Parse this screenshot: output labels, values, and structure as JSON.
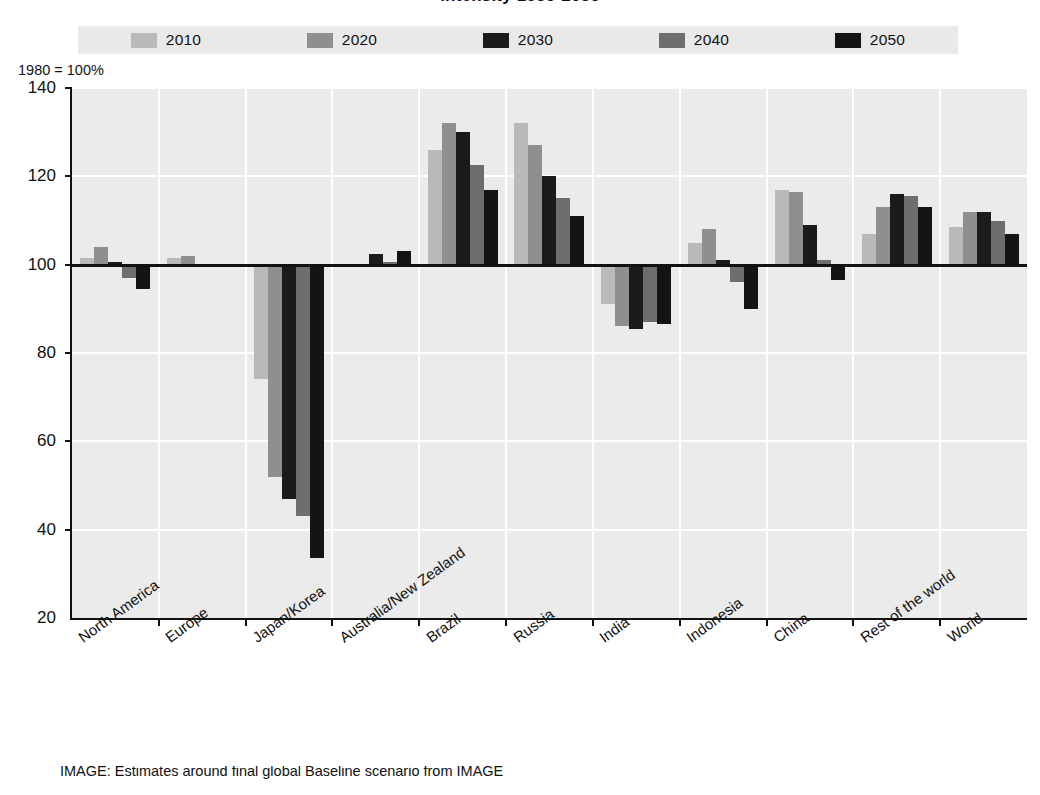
{
  "title": "intensity 1980-2050",
  "axis_note": "1980 = 100%",
  "caption": "IMAGE: Estimates around final global  Baseline scenario from IMAGE",
  "legend": {
    "items": [
      {
        "label": "2010",
        "color": "#b9b9b9"
      },
      {
        "label": "2020",
        "color": "#8f8f8f"
      },
      {
        "label": "2030",
        "color": "#1b1b1b"
      },
      {
        "label": "2040",
        "color": "#6e6e6e"
      },
      {
        "label": "2050",
        "color": "#141414"
      }
    ]
  },
  "chart_data": {
    "type": "bar",
    "title": "intensity 1980-2050",
    "xlabel": "",
    "ylabel": "1980 = 100%",
    "ylim": [
      20,
      140
    ],
    "yticks": [
      20,
      40,
      60,
      80,
      100,
      120,
      140
    ],
    "baseline": 100,
    "grid": true,
    "legend_position": "top",
    "categories": [
      "North America",
      "Europe",
      "Japan/Korea",
      "Australia/New Zealand",
      "Brazil",
      "Russia",
      "India",
      "Indonesia",
      "China",
      "Rest of the world",
      "World"
    ],
    "series": [
      {
        "name": "2010",
        "color": "#b9b9b9",
        "values": [
          101.5,
          101.5,
          74,
          99.5,
          126,
          132,
          91,
          105,
          117,
          107,
          108.5
        ]
      },
      {
        "name": "2020",
        "color": "#8f8f8f",
        "values": [
          104,
          102,
          52,
          99.5,
          132,
          127,
          86,
          108,
          116.5,
          113,
          112
        ]
      },
      {
        "name": "2030",
        "color": "#1b1b1b",
        "values": [
          100.5,
          100.2,
          47,
          102.5,
          130,
          120,
          85.5,
          101,
          109,
          116,
          112
        ]
      },
      {
        "name": "2040",
        "color": "#6e6e6e",
        "values": [
          97,
          100.2,
          43,
          100.5,
          122.5,
          115,
          87,
          96,
          101,
          115.5,
          110
        ]
      },
      {
        "name": "2050",
        "color": "#141414",
        "values": [
          94.5,
          100.1,
          33.5,
          103,
          117,
          111,
          86.5,
          90,
          96.5,
          113,
          107
        ]
      }
    ]
  }
}
